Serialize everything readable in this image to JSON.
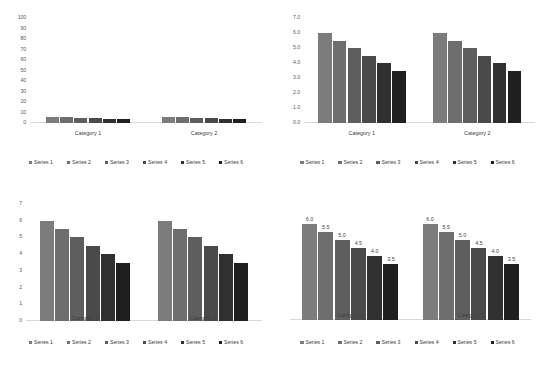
{
  "palette": {
    "series_colors": [
      "#7C7C7C",
      "#6E6E6E",
      "#5E5E5E",
      "#4A4A4A",
      "#303030",
      "#1F1F1F"
    ],
    "axis_line": "#D9D9D9",
    "text": "#404040",
    "background": "#FFFFFF"
  },
  "series_names": [
    "Series 1",
    "Series 2",
    "Series 3",
    "Series 4",
    "Series 5",
    "Series 6"
  ],
  "categories": [
    "Category 1",
    "Category 2"
  ],
  "chart_data": [
    {
      "id": "chart-top-left",
      "type": "bar",
      "title": "",
      "xlabel": "",
      "ylabel": "",
      "categories": [
        "Category 1",
        "Category 2"
      ],
      "series": [
        {
          "name": "Series 1",
          "values": [
            6.0,
            6.0
          ]
        },
        {
          "name": "Series 2",
          "values": [
            5.5,
            5.5
          ]
        },
        {
          "name": "Series 3",
          "values": [
            5.0,
            5.0
          ]
        },
        {
          "name": "Series 4",
          "values": [
            4.5,
            4.5
          ]
        },
        {
          "name": "Series 5",
          "values": [
            4.0,
            4.0
          ]
        },
        {
          "name": "Series 6",
          "values": [
            3.5,
            3.5
          ]
        }
      ],
      "ylim": [
        0,
        100
      ],
      "yticks": [
        0,
        10,
        20,
        30,
        40,
        50,
        60,
        70,
        80,
        90,
        100
      ],
      "ytick_labels": [
        "0",
        "10",
        "20",
        "30",
        "40",
        "50",
        "60",
        "70",
        "80",
        "90",
        "100"
      ],
      "show_y_axis": true,
      "show_data_labels": false,
      "grid": false,
      "legend_position": "bottom"
    },
    {
      "id": "chart-top-right",
      "type": "bar",
      "title": "",
      "xlabel": "",
      "ylabel": "",
      "categories": [
        "Category 1",
        "Category 2"
      ],
      "series": [
        {
          "name": "Series 1",
          "values": [
            6.0,
            6.0
          ]
        },
        {
          "name": "Series 2",
          "values": [
            5.5,
            5.5
          ]
        },
        {
          "name": "Series 3",
          "values": [
            5.0,
            5.0
          ]
        },
        {
          "name": "Series 4",
          "values": [
            4.5,
            4.5
          ]
        },
        {
          "name": "Series 5",
          "values": [
            4.0,
            4.0
          ]
        },
        {
          "name": "Series 6",
          "values": [
            3.5,
            3.5
          ]
        }
      ],
      "ylim": [
        0,
        7
      ],
      "yticks": [
        0,
        1,
        2,
        3,
        4,
        5,
        6,
        7
      ],
      "ytick_labels": [
        "0.0",
        "1.0",
        "2.0",
        "3.0",
        "4.0",
        "5.0",
        "6.0",
        "7.0"
      ],
      "show_y_axis": true,
      "show_data_labels": false,
      "grid": false,
      "legend_position": "bottom"
    },
    {
      "id": "chart-bottom-left",
      "type": "bar",
      "title": "",
      "xlabel": "",
      "ylabel": "",
      "categories": [
        "Category 1",
        "Category 2"
      ],
      "series": [
        {
          "name": "Series 1",
          "values": [
            6.0,
            6.0
          ]
        },
        {
          "name": "Series 2",
          "values": [
            5.5,
            5.5
          ]
        },
        {
          "name": "Series 3",
          "values": [
            5.0,
            5.0
          ]
        },
        {
          "name": "Series 4",
          "values": [
            4.5,
            4.5
          ]
        },
        {
          "name": "Series 5",
          "values": [
            4.0,
            4.0
          ]
        },
        {
          "name": "Series 6",
          "values": [
            3.5,
            3.5
          ]
        }
      ],
      "ylim": [
        0,
        7
      ],
      "yticks": [
        0,
        1,
        2,
        3,
        4,
        5,
        6,
        7
      ],
      "ytick_labels": [
        "0",
        "1",
        "2",
        "3",
        "4",
        "5",
        "6",
        "7"
      ],
      "show_y_axis": true,
      "show_data_labels": false,
      "grid": false,
      "legend_position": "bottom"
    },
    {
      "id": "chart-bottom-right",
      "type": "bar",
      "title": "",
      "xlabel": "",
      "ylabel": "",
      "categories": [
        "Category 1",
        "Category 2"
      ],
      "series": [
        {
          "name": "Series 1",
          "values": [
            6.0,
            6.0
          ]
        },
        {
          "name": "Series 2",
          "values": [
            5.5,
            5.5
          ]
        },
        {
          "name": "Series 3",
          "values": [
            5.0,
            5.0
          ]
        },
        {
          "name": "Series 4",
          "values": [
            4.5,
            4.5
          ]
        },
        {
          "name": "Series 5",
          "values": [
            4.0,
            4.0
          ]
        },
        {
          "name": "Series 6",
          "values": [
            3.5,
            3.5
          ]
        }
      ],
      "data_labels": [
        [
          "6.0",
          "5.5",
          "5.0",
          "4.5",
          "4.0",
          "3.5"
        ],
        [
          "6.0",
          "5.5",
          "5.0",
          "4.5",
          "4.0",
          "3.5"
        ]
      ],
      "ylim": [
        0,
        7
      ],
      "yticks": [],
      "ytick_labels": [],
      "show_y_axis": false,
      "show_data_labels": true,
      "grid": false,
      "legend_position": "bottom"
    }
  ]
}
